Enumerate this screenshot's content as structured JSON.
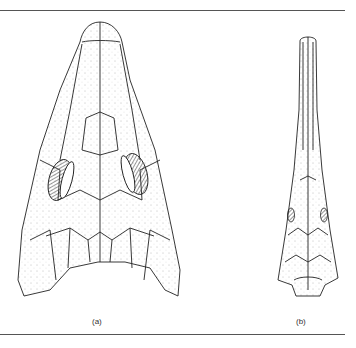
{
  "figure": {
    "panels": [
      {
        "id": "a",
        "label": "(a)",
        "description": "skull dorsal view, broad triangular"
      },
      {
        "id": "b",
        "label": "(b)",
        "description": "skull dorsal view, long narrow snout"
      }
    ],
    "colors": {
      "line": "#222222",
      "rule": "#555555",
      "background": "#ffffff"
    }
  }
}
